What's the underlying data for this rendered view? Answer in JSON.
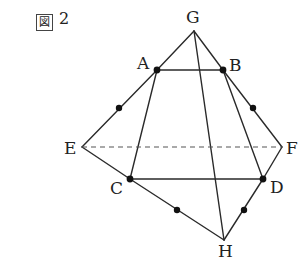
{
  "figure": {
    "title_symbol": "図",
    "title_number": "2"
  },
  "points": {
    "G": {
      "label": "G",
      "x": 194,
      "y": 31
    },
    "A": {
      "label": "A",
      "x": 157,
      "y": 70
    },
    "B": {
      "label": "B",
      "x": 223,
      "y": 70
    },
    "E": {
      "label": "E",
      "x": 82,
      "y": 147
    },
    "F": {
      "label": "F",
      "x": 282,
      "y": 147
    },
    "C": {
      "label": "C",
      "x": 130,
      "y": 179
    },
    "D": {
      "label": "D",
      "x": 263,
      "y": 179
    },
    "H": {
      "label": "H",
      "x": 224,
      "y": 240
    }
  },
  "midpoint_marks": [
    {
      "segment": "AE",
      "x": 119,
      "y": 108
    },
    {
      "segment": "BF",
      "x": 253,
      "y": 108
    },
    {
      "segment": "CH",
      "x": 177,
      "y": 210
    },
    {
      "segment": "DH",
      "x": 244,
      "y": 210
    }
  ],
  "segments": [
    "GA",
    "GB",
    "AB",
    "GH",
    "AC",
    "BD",
    "AE",
    "EC",
    "BF",
    "FD",
    "CD",
    "CH",
    "DH"
  ],
  "dashed_segments": [
    "EF"
  ],
  "colors": {
    "line": "#2a2a2a",
    "dashed": "#555555",
    "dot": "#111111"
  }
}
